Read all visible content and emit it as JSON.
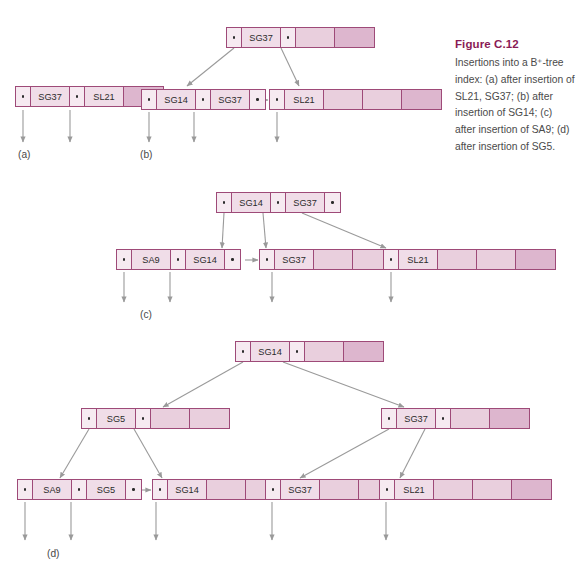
{
  "figure": {
    "title": "Figure C.12",
    "caption": "Insertions into a B⁺-tree index: (a) after insertion of SL21, SG37; (b) after insertion of SG14; (c) after insertion of SA9; (d) after insertion of SG5.",
    "accent_color": "#8a1a55",
    "node_border_color": "#9e4a78",
    "pointer_cell_color": "#f6eaf1",
    "key_cell_color": "#f0dde8",
    "blank_light_color": "#e9cfdd",
    "blank_dark_color": "#ddb6ce",
    "arrow_color": "#9a9a9a",
    "dot_glyph": "•"
  },
  "panels": [
    {
      "label": "(a)",
      "nodes": [
        {
          "id": "a-leaf",
          "cells": [
            "ptr",
            "SG37",
            "ptr",
            "SL21",
            "blank_dark"
          ]
        }
      ]
    },
    {
      "label": "(b)",
      "nodes": [
        {
          "id": "b-root",
          "cells": [
            "ptr",
            "SG37",
            "ptr",
            "blank_light",
            "blank_dark"
          ]
        },
        {
          "id": "b-leaf1",
          "cells": [
            "ptr",
            "SG14",
            "ptr",
            "SG37",
            "ptr"
          ]
        },
        {
          "id": "b-leaf2",
          "cells": [
            "ptr",
            "SL21",
            "blank_light",
            "blank_light",
            "blank_dark"
          ]
        }
      ]
    },
    {
      "label": "(c)",
      "nodes": [
        {
          "id": "c-root",
          "cells": [
            "ptr",
            "SG14",
            "ptr",
            "SG37",
            "ptr"
          ]
        },
        {
          "id": "c-leaf1",
          "cells": [
            "ptr",
            "SA9",
            "ptr",
            "SG14",
            "ptr"
          ]
        },
        {
          "id": "c-leaf2",
          "cells": [
            "ptr",
            "SG37",
            "blank_light",
            "blank_light",
            "ptr"
          ]
        },
        {
          "id": "c-leaf3",
          "cells": [
            "ptr",
            "SL21",
            "blank_light",
            "blank_light",
            "blank_dark"
          ]
        }
      ]
    },
    {
      "label": "(d)",
      "nodes": [
        {
          "id": "d-root",
          "cells": [
            "ptr",
            "SG14",
            "ptr",
            "blank_light",
            "blank_dark"
          ]
        },
        {
          "id": "d-int1",
          "cells": [
            "ptr",
            "SG5",
            "ptr",
            "blank_light",
            "blank_light"
          ]
        },
        {
          "id": "d-int2",
          "cells": [
            "ptr",
            "SG37",
            "ptr",
            "blank_light",
            "blank_dark"
          ]
        },
        {
          "id": "d-leaf1",
          "cells": [
            "ptr",
            "SA9",
            "ptr",
            "SG5",
            "ptr"
          ]
        },
        {
          "id": "d-leaf2",
          "cells": [
            "ptr",
            "SG14",
            "blank_light",
            "blank_light",
            "ptr"
          ]
        },
        {
          "id": "d-leaf3",
          "cells": [
            "ptr",
            "SG37",
            "blank_light",
            "blank_light",
            "ptr"
          ]
        },
        {
          "id": "d-leaf4",
          "cells": [
            "ptr",
            "SL21",
            "blank_light",
            "blank_light",
            "blank_dark"
          ]
        }
      ]
    }
  ],
  "chart_data": {
    "type": "diagram",
    "title": "Figure C.12",
    "keys_used": [
      "SA9",
      "SG5",
      "SG14",
      "SG37",
      "SL21"
    ],
    "node_capacity_cells": 5
  }
}
